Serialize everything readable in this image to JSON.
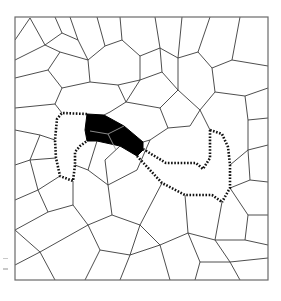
{
  "figure": {
    "frame": {
      "x": 15,
      "y": 17,
      "width": 253,
      "height": 263
    },
    "colors": {
      "background": "#ffffff",
      "edge": "#3a3a3a",
      "frame": "#6a6a6a",
      "region": "#000000",
      "region_inner_edge": "#9a9a9a",
      "dotted_path": "#111111"
    },
    "highlighted_region": {
      "outline": [
        [
          87,
          114
        ],
        [
          104,
          115
        ],
        [
          124,
          126
        ],
        [
          143,
          142
        ],
        [
          143,
          150
        ],
        [
          137,
          156
        ],
        [
          120,
          146
        ],
        [
          97,
          141
        ],
        [
          87,
          141
        ],
        [
          85,
          130
        ]
      ],
      "inner_edges": [
        [
          [
            90,
            131
          ],
          [
            108,
            134
          ],
          [
            124,
            126
          ]
        ],
        [
          [
            108,
            134
          ],
          [
            116,
            150
          ]
        ]
      ]
    },
    "dotted_paths": [
      {
        "name": "left-loop",
        "points": [
          [
            87,
            114
          ],
          [
            62,
            113
          ],
          [
            57,
            119
          ],
          [
            55,
            140
          ],
          [
            56,
            158
          ],
          [
            60,
            176
          ],
          [
            73,
            181
          ],
          [
            75,
            165
          ],
          [
            75,
            152
          ],
          [
            80,
            146
          ],
          [
            87,
            141
          ]
        ]
      },
      {
        "name": "right-upper",
        "points": [
          [
            143,
            149
          ],
          [
            166,
            163
          ],
          [
            196,
            163
          ],
          [
            203,
            169
          ],
          [
            210,
            158
          ],
          [
            210,
            130
          ]
        ]
      },
      {
        "name": "right-outer",
        "points": [
          [
            210,
            130
          ],
          [
            222,
            134
          ],
          [
            228,
            147
          ],
          [
            230,
            165
          ],
          [
            230,
            188
          ],
          [
            222,
            202
          ]
        ]
      },
      {
        "name": "right-lower",
        "points": [
          [
            137,
            156
          ],
          [
            162,
            183
          ],
          [
            185,
            195
          ],
          [
            212,
            195
          ],
          [
            222,
            202
          ]
        ]
      }
    ],
    "mesh_edges": [
      [
        [
          15,
          40
        ],
        [
          30,
          18
        ]
      ],
      [
        [
          30,
          18
        ],
        [
          45,
          45
        ]
      ],
      [
        [
          45,
          45
        ],
        [
          15,
          60
        ]
      ],
      [
        [
          45,
          45
        ],
        [
          62,
          33
        ]
      ],
      [
        [
          62,
          33
        ],
        [
          55,
          17
        ]
      ],
      [
        [
          62,
          33
        ],
        [
          78,
          40
        ]
      ],
      [
        [
          78,
          40
        ],
        [
          70,
          17
        ]
      ],
      [
        [
          78,
          40
        ],
        [
          88,
          60
        ]
      ],
      [
        [
          88,
          60
        ],
        [
          60,
          52
        ]
      ],
      [
        [
          60,
          52
        ],
        [
          45,
          45
        ]
      ],
      [
        [
          60,
          52
        ],
        [
          48,
          70
        ]
      ],
      [
        [
          48,
          70
        ],
        [
          15,
          78
        ]
      ],
      [
        [
          48,
          70
        ],
        [
          62,
          88
        ]
      ],
      [
        [
          62,
          88
        ],
        [
          90,
          82
        ]
      ],
      [
        [
          90,
          82
        ],
        [
          88,
          60
        ]
      ],
      [
        [
          88,
          60
        ],
        [
          105,
          46
        ]
      ],
      [
        [
          105,
          46
        ],
        [
          97,
          17
        ]
      ],
      [
        [
          105,
          46
        ],
        [
          122,
          40
        ]
      ],
      [
        [
          122,
          40
        ],
        [
          120,
          17
        ]
      ],
      [
        [
          122,
          40
        ],
        [
          140,
          56
        ]
      ],
      [
        [
          140,
          56
        ],
        [
          160,
          48
        ]
      ],
      [
        [
          160,
          48
        ],
        [
          155,
          17
        ]
      ],
      [
        [
          160,
          48
        ],
        [
          178,
          58
        ]
      ],
      [
        [
          178,
          58
        ],
        [
          182,
          17
        ]
      ],
      [
        [
          140,
          56
        ],
        [
          140,
          80
        ]
      ],
      [
        [
          140,
          80
        ],
        [
          118,
          85
        ]
      ],
      [
        [
          118,
          85
        ],
        [
          90,
          82
        ]
      ],
      [
        [
          118,
          85
        ],
        [
          126,
          102
        ]
      ],
      [
        [
          126,
          102
        ],
        [
          140,
          80
        ]
      ],
      [
        [
          140,
          80
        ],
        [
          162,
          72
        ]
      ],
      [
        [
          162,
          72
        ],
        [
          160,
          48
        ]
      ],
      [
        [
          162,
          72
        ],
        [
          178,
          90
        ]
      ],
      [
        [
          178,
          90
        ],
        [
          178,
          58
        ]
      ],
      [
        [
          178,
          58
        ],
        [
          198,
          52
        ]
      ],
      [
        [
          198,
          52
        ],
        [
          210,
          17
        ]
      ],
      [
        [
          198,
          52
        ],
        [
          212,
          68
        ]
      ],
      [
        [
          212,
          68
        ],
        [
          232,
          60
        ]
      ],
      [
        [
          232,
          60
        ],
        [
          240,
          17
        ]
      ],
      [
        [
          232,
          60
        ],
        [
          268,
          66
        ]
      ],
      [
        [
          212,
          68
        ],
        [
          215,
          92
        ]
      ],
      [
        [
          215,
          92
        ],
        [
          245,
          96
        ]
      ],
      [
        [
          245,
          96
        ],
        [
          268,
          88
        ]
      ],
      [
        [
          245,
          96
        ],
        [
          248,
          120
        ]
      ],
      [
        [
          248,
          120
        ],
        [
          268,
          118
        ]
      ],
      [
        [
          215,
          92
        ],
        [
          200,
          110
        ]
      ],
      [
        [
          200,
          110
        ],
        [
          178,
          90
        ]
      ],
      [
        [
          200,
          110
        ],
        [
          210,
          130
        ]
      ],
      [
        [
          178,
          90
        ],
        [
          160,
          108
        ]
      ],
      [
        [
          160,
          108
        ],
        [
          126,
          102
        ]
      ],
      [
        [
          160,
          108
        ],
        [
          168,
          128
        ]
      ],
      [
        [
          168,
          128
        ],
        [
          190,
          126
        ]
      ],
      [
        [
          190,
          126
        ],
        [
          200,
          110
        ]
      ],
      [
        [
          168,
          128
        ],
        [
          150,
          140
        ]
      ],
      [
        [
          150,
          140
        ],
        [
          143,
          142
        ]
      ],
      [
        [
          126,
          102
        ],
        [
          110,
          112
        ]
      ],
      [
        [
          110,
          112
        ],
        [
          104,
          115
        ]
      ],
      [
        [
          62,
          88
        ],
        [
          55,
          104
        ]
      ],
      [
        [
          55,
          104
        ],
        [
          62,
          113
        ]
      ],
      [
        [
          55,
          104
        ],
        [
          15,
          108
        ]
      ],
      [
        [
          15,
          130
        ],
        [
          40,
          135
        ]
      ],
      [
        [
          40,
          135
        ],
        [
          55,
          140
        ]
      ],
      [
        [
          40,
          135
        ],
        [
          30,
          160
        ]
      ],
      [
        [
          30,
          160
        ],
        [
          15,
          165
        ]
      ],
      [
        [
          30,
          160
        ],
        [
          56,
          158
        ]
      ],
      [
        [
          30,
          160
        ],
        [
          38,
          190
        ]
      ],
      [
        [
          38,
          190
        ],
        [
          60,
          176
        ]
      ],
      [
        [
          38,
          190
        ],
        [
          15,
          200
        ]
      ],
      [
        [
          38,
          190
        ],
        [
          48,
          212
        ]
      ],
      [
        [
          48,
          212
        ],
        [
          73,
          205
        ]
      ],
      [
        [
          73,
          205
        ],
        [
          73,
          181
        ]
      ],
      [
        [
          73,
          205
        ],
        [
          88,
          225
        ]
      ],
      [
        [
          88,
          225
        ],
        [
          112,
          215
        ]
      ],
      [
        [
          112,
          215
        ],
        [
          108,
          185
        ]
      ],
      [
        [
          108,
          185
        ],
        [
          88,
          170
        ]
      ],
      [
        [
          88,
          170
        ],
        [
          75,
          165
        ]
      ],
      [
        [
          88,
          170
        ],
        [
          97,
          141
        ]
      ],
      [
        [
          108,
          185
        ],
        [
          137,
          170
        ]
      ],
      [
        [
          112,
          215
        ],
        [
          140,
          225
        ]
      ],
      [
        [
          140,
          225
        ],
        [
          162,
          183
        ]
      ],
      [
        [
          140,
          225
        ],
        [
          160,
          245
        ]
      ],
      [
        [
          160,
          245
        ],
        [
          188,
          233
        ]
      ],
      [
        [
          188,
          233
        ],
        [
          185,
          195
        ]
      ],
      [
        [
          188,
          233
        ],
        [
          215,
          240
        ]
      ],
      [
        [
          215,
          240
        ],
        [
          222,
          202
        ]
      ],
      [
        [
          215,
          240
        ],
        [
          230,
          262
        ]
      ],
      [
        [
          230,
          262
        ],
        [
          268,
          258
        ]
      ],
      [
        [
          230,
          188
        ],
        [
          250,
          180
        ]
      ],
      [
        [
          250,
          180
        ],
        [
          268,
          182
        ]
      ],
      [
        [
          250,
          180
        ],
        [
          248,
          150
        ]
      ],
      [
        [
          248,
          150
        ],
        [
          230,
          165
        ]
      ],
      [
        [
          248,
          150
        ],
        [
          268,
          145
        ]
      ],
      [
        [
          248,
          150
        ],
        [
          248,
          120
        ]
      ],
      [
        [
          230,
          188
        ],
        [
          248,
          215
        ]
      ],
      [
        [
          248,
          215
        ],
        [
          268,
          215
        ]
      ],
      [
        [
          248,
          215
        ],
        [
          245,
          240
        ]
      ],
      [
        [
          245,
          240
        ],
        [
          215,
          240
        ]
      ],
      [
        [
          245,
          240
        ],
        [
          268,
          245
        ]
      ],
      [
        [
          15,
          230
        ],
        [
          48,
          212
        ]
      ],
      [
        [
          15,
          230
        ],
        [
          40,
          252
        ]
      ],
      [
        [
          40,
          252
        ],
        [
          88,
          225
        ]
      ],
      [
        [
          40,
          252
        ],
        [
          55,
          280
        ]
      ],
      [
        [
          40,
          252
        ],
        [
          15,
          265
        ]
      ],
      [
        [
          88,
          225
        ],
        [
          100,
          250
        ]
      ],
      [
        [
          100,
          250
        ],
        [
          85,
          280
        ]
      ],
      [
        [
          100,
          250
        ],
        [
          130,
          255
        ]
      ],
      [
        [
          130,
          255
        ],
        [
          140,
          225
        ]
      ],
      [
        [
          130,
          255
        ],
        [
          120,
          280
        ]
      ],
      [
        [
          130,
          255
        ],
        [
          160,
          245
        ]
      ],
      [
        [
          160,
          245
        ],
        [
          170,
          280
        ]
      ],
      [
        [
          188,
          233
        ],
        [
          200,
          262
        ]
      ],
      [
        [
          200,
          262
        ],
        [
          230,
          262
        ]
      ],
      [
        [
          200,
          262
        ],
        [
          195,
          280
        ]
      ],
      [
        [
          230,
          262
        ],
        [
          240,
          280
        ]
      ],
      [
        [
          120,
          146
        ],
        [
          105,
          160
        ]
      ],
      [
        [
          105,
          160
        ],
        [
          108,
          185
        ]
      ],
      [
        [
          137,
          170
        ],
        [
          150,
          140
        ]
      ]
    ]
  }
}
